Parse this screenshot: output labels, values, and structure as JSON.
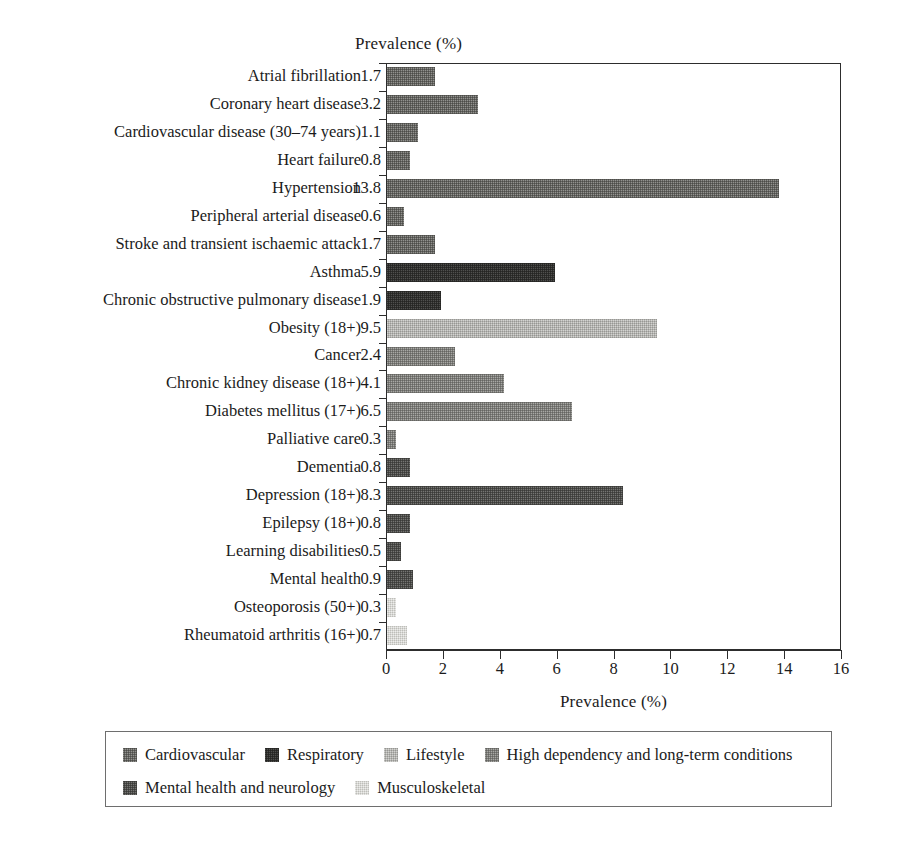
{
  "chart_data": {
    "type": "bar",
    "orientation": "horizontal",
    "title": "Prevalence (%)",
    "xlabel": "Prevalence (%)",
    "ylabel": "",
    "xlim": [
      0,
      16
    ],
    "xticks": [
      0,
      2,
      4,
      6,
      8,
      10,
      12,
      14,
      16
    ],
    "grid": false,
    "legend_position": "bottom",
    "categories": [
      "Atrial fibrillation",
      "Coronary heart disease",
      "Cardiovascular disease (30–74 years)",
      "Heart failure",
      "Hypertension",
      "Peripheral arterial disease",
      "Stroke and transient ischaemic attack",
      "Asthma",
      "Chronic obstructive pulmonary disease",
      "Obesity (18+)",
      "Cancer",
      "Chronic kidney disease (18+)",
      "Diabetes mellitus (17+)",
      "Palliative care",
      "Dementia",
      "Depression (18+)",
      "Epilepsy (18+)",
      "Learning disabilities",
      "Mental health",
      "Osteoporosis (50+)",
      "Rheumatoid arthritis (16+)"
    ],
    "values": [
      1.7,
      3.2,
      1.1,
      0.8,
      13.8,
      0.6,
      1.7,
      5.9,
      1.9,
      9.5,
      2.4,
      4.1,
      6.5,
      0.3,
      0.8,
      8.3,
      0.8,
      0.5,
      0.9,
      0.3,
      0.7
    ],
    "value_labels": [
      "1.7",
      "3.2",
      "1.1",
      "0.8",
      "13.8",
      "0.6",
      "1.7",
      "5.9",
      "1.9",
      "9.5",
      "2.4",
      "4.1",
      "6.5",
      "0.3",
      "0.8",
      "8.3",
      "0.8",
      "0.5",
      "0.9",
      "0.3",
      "0.7"
    ],
    "groups": [
      "cardiovascular",
      "cardiovascular",
      "cardiovascular",
      "cardiovascular",
      "cardiovascular",
      "cardiovascular",
      "cardiovascular",
      "respiratory",
      "respiratory",
      "lifestyle",
      "high-dependency",
      "high-dependency",
      "high-dependency",
      "high-dependency",
      "mental-health",
      "mental-health",
      "mental-health",
      "mental-health",
      "mental-health",
      "musculoskeletal",
      "musculoskeletal"
    ]
  },
  "legend": {
    "row1": [
      {
        "key": "cardiovascular",
        "label": "Cardiovascular",
        "color": "#63635f"
      },
      {
        "key": "respiratory",
        "label": "Respiratory",
        "color": "#2e2e2c"
      },
      {
        "key": "lifestyle",
        "label": "Lifestyle",
        "color": "#b4b4b0"
      },
      {
        "key": "high-dependency",
        "label": "High dependency and long-term conditions",
        "color": "#7b7b77"
      }
    ],
    "row2": [
      {
        "key": "mental-health",
        "label": "Mental health and neurology",
        "color": "#4a4a47"
      },
      {
        "key": "musculoskeletal",
        "label": "Musculoskeletal",
        "color": "#d8d8d4"
      }
    ]
  }
}
